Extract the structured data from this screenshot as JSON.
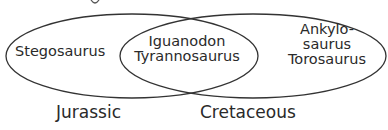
{
  "diagram": {
    "type": "venn",
    "sets": [
      {
        "label": "Jurassic",
        "only": [
          "Stegosaurus"
        ]
      },
      {
        "label": "Cretaceous",
        "only": [
          "Ankylo-",
          "saurus",
          "Torosaurus"
        ]
      }
    ],
    "intersection": [
      "Iguanodon",
      "Tyrannosaurus"
    ],
    "stroke_color": "#333333"
  }
}
